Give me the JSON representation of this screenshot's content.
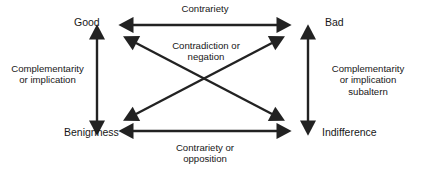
{
  "diagram": {
    "type": "semiotic-square",
    "stroke_color": "#222222",
    "text_color": "#171717",
    "background_color": "#ffffff",
    "nodes": [
      {
        "id": "good",
        "label": "Good",
        "position": "top-left"
      },
      {
        "id": "bad",
        "label": "Bad",
        "position": "top-right"
      },
      {
        "id": "benignness",
        "label": "Benignness",
        "position": "bottom-left"
      },
      {
        "id": "indifference",
        "label": "Indifference",
        "position": "bottom-right"
      }
    ],
    "relations": [
      {
        "id": "contrariety-top",
        "label": "Contrariety",
        "from": "good",
        "to": "bad",
        "orientation": "horizontal",
        "arrowheads": "both",
        "label_position": "above"
      },
      {
        "id": "contradiction",
        "label": "Contradiction or\nnegation",
        "from": "good",
        "to": "indifference",
        "orientation": "diagonal",
        "arrowheads": "both",
        "label_position": "center"
      },
      {
        "id": "contradiction-2",
        "label": "",
        "from": "bad",
        "to": "benignness",
        "orientation": "diagonal",
        "arrowheads": "both",
        "label_position": "center"
      },
      {
        "id": "complementarity-left",
        "label": "Complementarity\nor implication",
        "from": "good",
        "to": "benignness",
        "orientation": "vertical",
        "arrowheads": "both",
        "label_position": "left"
      },
      {
        "id": "complementarity-right",
        "label": "Complementarity\nor implication\nsubaltern",
        "from": "bad",
        "to": "indifference",
        "orientation": "vertical",
        "arrowheads": "both",
        "label_position": "right"
      },
      {
        "id": "contrariety-bottom",
        "label": "Contrariety or\nopposition",
        "from": "benignness",
        "to": "indifference",
        "orientation": "horizontal",
        "arrowheads": "both",
        "label_position": "below"
      }
    ]
  }
}
